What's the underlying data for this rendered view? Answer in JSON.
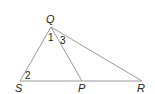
{
  "diagram": {
    "type": "triangle",
    "line_color": "#9a9a9a",
    "text_color": "#222222",
    "points": {
      "Q": {
        "label": "Q",
        "x": 51,
        "y": 27
      },
      "S": {
        "label": "S",
        "x": 20,
        "y": 81
      },
      "P": {
        "label": "P",
        "x": 82,
        "y": 81
      },
      "R": {
        "label": "R",
        "x": 142,
        "y": 81
      }
    },
    "segments": [
      "QS",
      "QP",
      "QR",
      "SR"
    ],
    "angles": [
      {
        "label": "1",
        "vertex": "Q",
        "between": "QS-QP"
      },
      {
        "label": "2",
        "vertex": "S",
        "between": "SQ-SR"
      },
      {
        "label": "3",
        "vertex": "Q",
        "between": "QP-QR"
      }
    ]
  }
}
